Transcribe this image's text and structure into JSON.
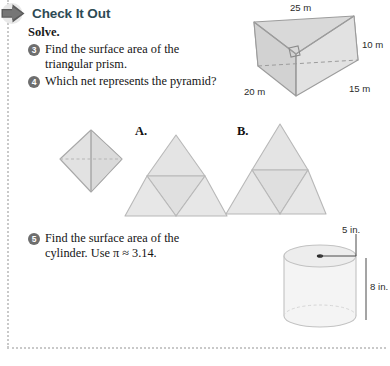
{
  "header": {
    "title": "Check It Out",
    "arrow_icon": "right-arrow-icon",
    "accent_color": "#2e4a54"
  },
  "instruction": "Solve.",
  "problems": [
    {
      "number": "3",
      "text": "Find the surface area of the triangular prism."
    },
    {
      "number": "4",
      "text": "Which net represents the pyramid?"
    },
    {
      "number": "5",
      "text": "Find the surface area of the cylinder. Use π ≈ 3.14."
    }
  ],
  "choices": {
    "a_label": "A.",
    "b_label": "B."
  },
  "figures": {
    "prism": {
      "name": "triangular-prism",
      "labels": {
        "top": "25 m",
        "right": "10 m",
        "bottom_right": "15 m",
        "bottom_left": "20 m"
      },
      "fill": "#dcdcdc",
      "stroke": "#9a9a9a"
    },
    "octahedron": {
      "name": "octahedron-solid",
      "fill": "#e0e0e0",
      "stroke": "#a8a8a8"
    },
    "net_a": {
      "name": "pyramid-net-option-a",
      "fill": "#e2e2e2",
      "stroke": "#b4b4b4"
    },
    "net_b": {
      "name": "pyramid-net-option-b",
      "fill": "#e2e2e2",
      "stroke": "#b4b4b4"
    },
    "cylinder": {
      "name": "cylinder-solid",
      "labels": {
        "radius": "5 in.",
        "height": "8 in."
      },
      "fill": "#f2f2f2",
      "stroke": "#bdbdbd"
    }
  }
}
